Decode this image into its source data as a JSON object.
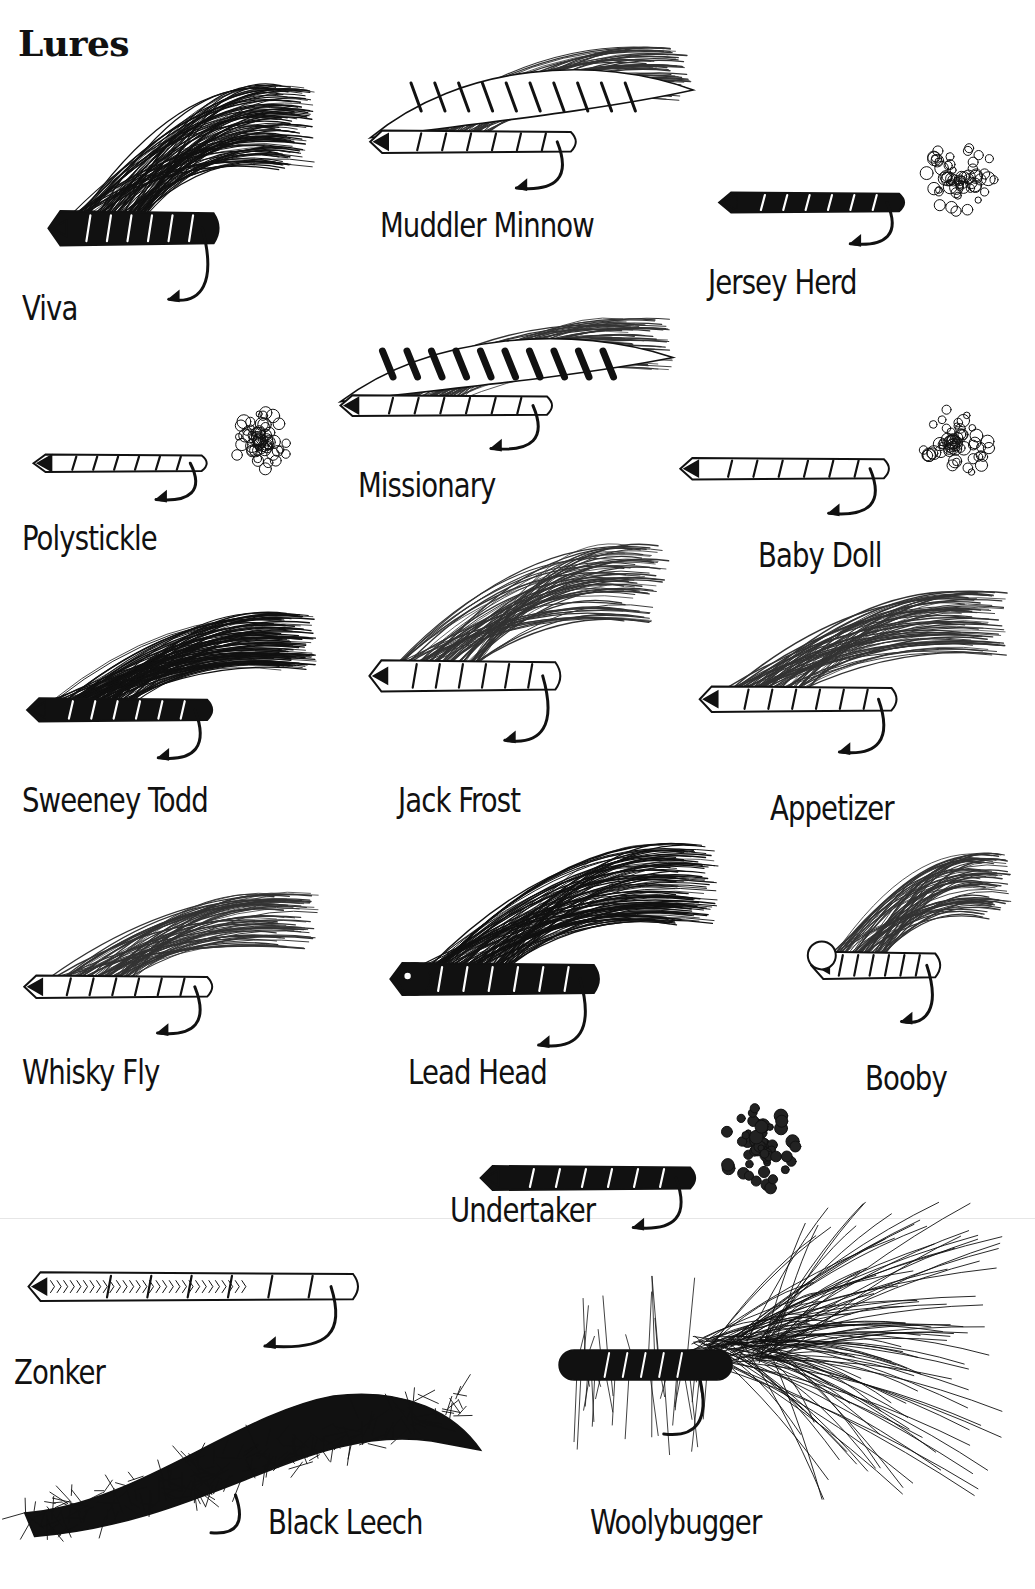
{
  "page": {
    "title": "Lures"
  },
  "lures": [
    {
      "name": "Viva",
      "style": "dark-hackle",
      "x": 40,
      "y": 95,
      "w": 280,
      "h": 215,
      "lx": 22,
      "ly": 288
    },
    {
      "name": "Muddler Minnow",
      "style": "streamer-wing",
      "x": 360,
      "y": 55,
      "w": 340,
      "h": 140,
      "lx": 380,
      "ly": 205
    },
    {
      "name": "Jersey Herd",
      "style": "dark-body-tail",
      "x": 710,
      "y": 125,
      "w": 305,
      "h": 125,
      "lx": 708,
      "ly": 262
    },
    {
      "name": "Polystickle",
      "style": "slim-body",
      "x": 25,
      "y": 395,
      "w": 285,
      "h": 110,
      "lx": 22,
      "ly": 518
    },
    {
      "name": "Missionary",
      "style": "barred-wing",
      "x": 330,
      "y": 325,
      "w": 350,
      "h": 130,
      "lx": 358,
      "ly": 465
    },
    {
      "name": "Baby Doll",
      "style": "puff-tail",
      "x": 670,
      "y": 385,
      "w": 345,
      "h": 135,
      "lx": 758,
      "ly": 535
    },
    {
      "name": "Sweeney Todd",
      "style": "dark-wing",
      "x": 18,
      "y": 620,
      "w": 305,
      "h": 145,
      "lx": 22,
      "ly": 780
    },
    {
      "name": "Jack Frost",
      "style": "white-wing",
      "x": 360,
      "y": 555,
      "w": 315,
      "h": 195,
      "lx": 398,
      "ly": 780
    },
    {
      "name": "Appetizer",
      "style": "white-wing-low",
      "x": 690,
      "y": 600,
      "w": 325,
      "h": 160,
      "lx": 770,
      "ly": 788
    },
    {
      "name": "Whisky Fly",
      "style": "slim-wing",
      "x": 15,
      "y": 900,
      "w": 310,
      "h": 140,
      "lx": 22,
      "ly": 1052
    },
    {
      "name": "Lead Head",
      "style": "bead-marabou",
      "x": 380,
      "y": 855,
      "w": 345,
      "h": 200,
      "lx": 408,
      "ly": 1052
    },
    {
      "name": "Booby",
      "style": "booby-eyes",
      "x": 805,
      "y": 860,
      "w": 210,
      "h": 170,
      "lx": 865,
      "ly": 1058
    },
    {
      "name": "Undertaker",
      "style": "dark-shell-puff",
      "x": 470,
      "y": 1085,
      "w": 355,
      "h": 150,
      "lx": 450,
      "ly": 1190
    },
    {
      "name": "Zonker",
      "style": "zonker-strip",
      "x": 12,
      "y": 1175,
      "w": 550,
      "h": 180,
      "lx": 14,
      "ly": 1352
    },
    {
      "name": "Black Leech",
      "style": "leech",
      "x": 15,
      "y": 1360,
      "w": 490,
      "h": 180,
      "lx": 268,
      "ly": 1502
    },
    {
      "name": "Woolybugger",
      "style": "woolybugger",
      "x": 550,
      "y": 1200,
      "w": 455,
      "h": 300,
      "lx": 590,
      "ly": 1502
    }
  ]
}
